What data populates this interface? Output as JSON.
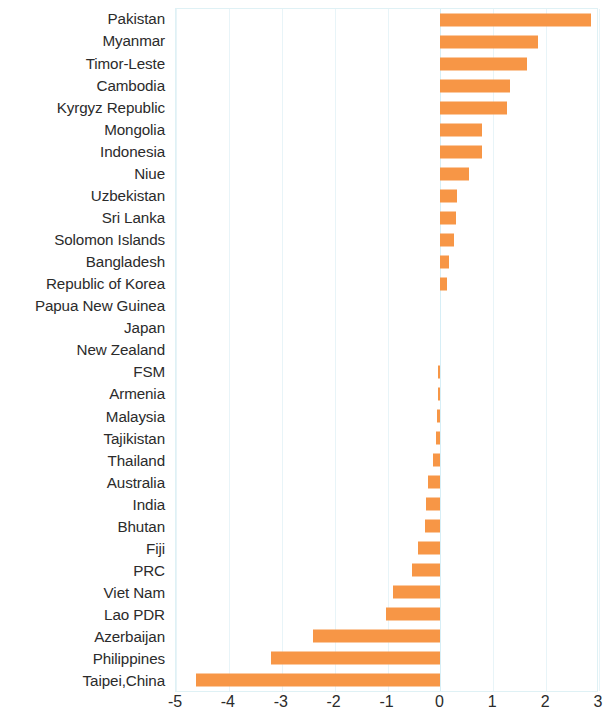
{
  "chart_data": {
    "type": "bar",
    "orientation": "horizontal",
    "title": "",
    "subtitle": "",
    "xlabel": "",
    "ylabel": "",
    "xlim": [
      -5,
      3
    ],
    "xticks": [
      -5,
      -4,
      -3,
      -2,
      -1,
      0,
      1,
      2,
      3
    ],
    "xtick_labels": [
      "-5",
      "-4",
      "-3",
      "-2",
      "-1",
      "0",
      "1",
      "2",
      "3"
    ],
    "grid": true,
    "grid_axis": "x",
    "legend": false,
    "bar_color": "#F79646",
    "categories": [
      "Pakistan",
      "Myanmar",
      "Timor-Leste",
      "Cambodia",
      "Kyrgyz Republic",
      "Mongolia",
      "Indonesia",
      "Niue",
      "Uzbekistan",
      "Sri Lanka",
      "Solomon Islands",
      "Bangladesh",
      "Republic of Korea",
      "Papua New Guinea",
      "Japan",
      "New Zealand",
      "FSM",
      "Armenia",
      "Malaysia",
      "Tajikistan",
      "Thailand",
      "Australia",
      "India",
      "Bhutan",
      "Fiji",
      "PRC",
      "Viet Nam",
      "Lao PDR",
      "Azerbaijan",
      "Philippines",
      "Taipei,China"
    ],
    "values": [
      2.85,
      1.85,
      1.64,
      1.32,
      1.26,
      0.78,
      0.78,
      0.55,
      0.32,
      0.3,
      0.26,
      0.16,
      0.12,
      0.0,
      0.0,
      0.0,
      -0.04,
      -0.05,
      -0.06,
      -0.09,
      -0.14,
      -0.23,
      -0.28,
      -0.3,
      -0.42,
      -0.53,
      -0.89,
      -1.02,
      -2.41,
      -3.2,
      -4.63
    ]
  }
}
